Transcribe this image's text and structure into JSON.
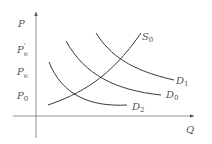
{
  "diagram": {
    "type": "supply-demand",
    "axes": {
      "y_label": "P",
      "x_label": "Q"
    },
    "price_levels": [
      {
        "id": "pe_prime",
        "base": "P",
        "sub": "e",
        "prime": "'"
      },
      {
        "id": "pe",
        "base": "P",
        "sub": "e",
        "prime": ""
      },
      {
        "id": "p0",
        "base": "P",
        "sub": "0",
        "prime": ""
      }
    ],
    "curves": [
      {
        "id": "S0",
        "base": "S",
        "sub": "0",
        "kind": "supply"
      },
      {
        "id": "D1",
        "base": "D",
        "sub": "1",
        "kind": "demand"
      },
      {
        "id": "D0",
        "base": "D",
        "sub": "0",
        "kind": "demand"
      },
      {
        "id": "D2",
        "base": "D",
        "sub": "2",
        "kind": "demand"
      }
    ],
    "colors": {
      "curve": "#3a3a3a",
      "axis": "#777777",
      "label": "#555555"
    }
  }
}
